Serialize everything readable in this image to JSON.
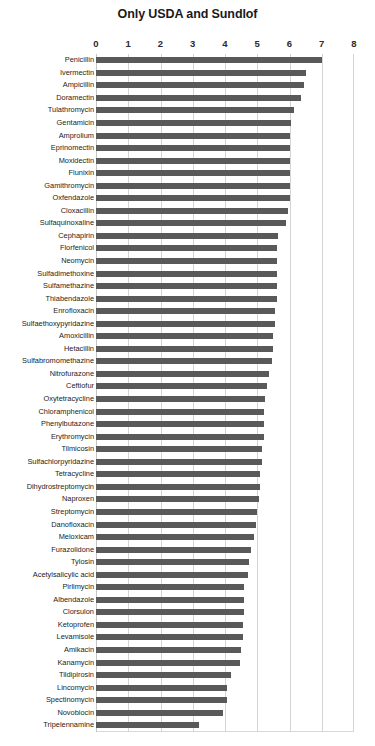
{
  "chart_data": {
    "type": "bar",
    "orientation": "horizontal",
    "title": "Only USDA and Sundlof",
    "xlabel": "",
    "ylabel": "",
    "xlim": [
      0,
      8
    ],
    "xticks": [
      0,
      1,
      2,
      3,
      4,
      5,
      6,
      7,
      8
    ],
    "xtick_labels": [
      "0",
      "1",
      "2",
      "3",
      "4",
      "5",
      "6",
      "7",
      "8"
    ],
    "grid": true,
    "legend": "none",
    "bar_color": "#595959",
    "gridline_color": "#d4d4d4",
    "categories": [
      "Penicillin",
      "Ivermectin",
      "Ampicillin",
      "Doramectin",
      "Tulathromycin",
      "Gentamicin",
      "Amprolium",
      "Eprinomectin",
      "Moxidectin",
      "Flunixin",
      "Gamithromycin",
      "Oxfendazole",
      "Cloxacillin",
      "Sulfaquinoxaline",
      "Cephapirin",
      "Florfenicol",
      "Neomycin",
      "Sulfadimethoxine",
      "Sulfamethazine",
      "Thiabendazole",
      "Enrofloxacin",
      "Sulfaethoxypyridazine",
      "Amoxicillin",
      "Hetacillin",
      "Sulfabromomethazine",
      "Nitrofurazone",
      "Ceftiofur",
      "Oxytetracycline",
      "Chloramphenicol",
      "Phenylbutazone",
      "Erythromycin",
      "Tilmicosin",
      "Sulfachlorpyridazine",
      "Tetracycline",
      "Dihydrostreptomycin",
      "Naproxen",
      "Streptomycin",
      "Danofloxacin",
      "Meloxicam",
      "Furazolidone",
      "Tylosin",
      "Acetylsalicylic acid",
      "Pirlimycin",
      "Albendazole",
      "Clorsulon",
      "Ketoprofen",
      "Levamisole",
      "Amikacin",
      "Kanamycin",
      "Tildipirosin",
      "Lincomycin",
      "Spectinomycin",
      "Novobiocin",
      "Tripelennamine"
    ],
    "values": [
      7.0,
      6.5,
      6.45,
      6.35,
      6.15,
      6.05,
      6.0,
      6.0,
      6.0,
      6.0,
      6.0,
      6.0,
      5.95,
      5.9,
      5.65,
      5.6,
      5.6,
      5.6,
      5.6,
      5.6,
      5.55,
      5.55,
      5.5,
      5.5,
      5.45,
      5.35,
      5.3,
      5.25,
      5.2,
      5.2,
      5.2,
      5.15,
      5.15,
      5.1,
      5.1,
      5.05,
      5.0,
      4.95,
      4.9,
      4.8,
      4.75,
      4.7,
      4.6,
      4.6,
      4.6,
      4.55,
      4.55,
      4.5,
      4.45,
      4.2,
      4.05,
      4.05,
      3.95,
      3.2
    ]
  }
}
